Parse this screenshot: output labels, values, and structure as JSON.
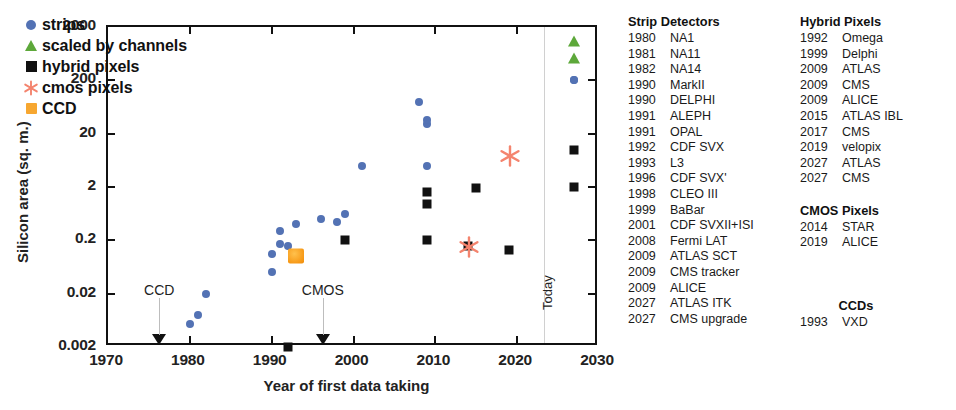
{
  "chart_data": {
    "type": "scatter",
    "title": "",
    "xlabel": "Year of first data taking",
    "ylabel": "Silicon area (sq. m.)",
    "xlim": [
      1970,
      2030
    ],
    "ylim": [
      0.002,
      2000
    ],
    "yscale": "log",
    "xticks": [
      1970,
      1980,
      1990,
      2000,
      2010,
      2020,
      2030
    ],
    "yticks": [
      0.002,
      0.02,
      0.2,
      2,
      20,
      200,
      2000
    ],
    "grid": false,
    "legend_position": "top-left",
    "legend": [
      {
        "label": "strips",
        "marker": "circle",
        "color": "#5372b4"
      },
      {
        "label": "scaled by channels",
        "marker": "triangle",
        "color": "#5da83a"
      },
      {
        "label": "hybrid pixels",
        "marker": "square",
        "color": "#111111"
      },
      {
        "label": "cmos pixels",
        "marker": "asterisk",
        "color": "#f4846e"
      },
      {
        "label": "CCD",
        "marker": "square",
        "color": "#f7a730"
      }
    ],
    "annotations": [
      {
        "text": "CCD",
        "x": 1976.5,
        "y": 0.03,
        "marker": "down-triangle-on-axis"
      },
      {
        "text": "CMOS",
        "x": 1996.5,
        "y": 0.03,
        "marker": "down-triangle-on-axis"
      },
      {
        "text": "Today",
        "x": 2023.5,
        "orientation": "vertical",
        "marker": "vertical-line"
      }
    ],
    "series": [
      {
        "name": "strips",
        "marker": "circle",
        "color": "#5372b4",
        "points": [
          [
            1980,
            0.0055
          ],
          [
            1981,
            0.008
          ],
          [
            1982,
            0.02
          ],
          [
            1990,
            0.05
          ],
          [
            1990,
            0.11
          ],
          [
            1991,
            0.17
          ],
          [
            1991,
            0.3
          ],
          [
            1992,
            0.16
          ],
          [
            1993,
            0.4
          ],
          [
            1996,
            0.5
          ],
          [
            1998,
            0.45
          ],
          [
            1999,
            0.62
          ],
          [
            2001,
            5.0
          ],
          [
            2008,
            80
          ],
          [
            2009,
            30
          ],
          [
            2009,
            36
          ],
          [
            2009,
            5.0
          ],
          [
            2027,
            200
          ],
          [
            2027,
            205
          ]
        ]
      },
      {
        "name": "scaled by channels",
        "marker": "triangle",
        "color": "#5da83a",
        "points": [
          [
            2027,
            1100
          ],
          [
            2027,
            520
          ]
        ]
      },
      {
        "name": "hybrid pixels",
        "marker": "square",
        "color": "#111111",
        "points": [
          [
            1992,
            0.002
          ],
          [
            1999,
            0.2
          ],
          [
            2009,
            1.6
          ],
          [
            2009,
            0.95
          ],
          [
            2009,
            0.2
          ],
          [
            2015,
            1.9
          ],
          [
            2014,
            0.16
          ],
          [
            2019,
            0.13
          ],
          [
            2027,
            10
          ],
          [
            2027,
            2.0
          ]
        ]
      },
      {
        "name": "cmos pixels",
        "marker": "asterisk",
        "color": "#f4846e",
        "points": [
          [
            2019,
            8.0
          ],
          [
            2014,
            0.16
          ]
        ]
      },
      {
        "name": "CCD",
        "marker": "square",
        "color": "#f7a730",
        "points": [
          [
            1993,
            0.1
          ]
        ]
      }
    ]
  },
  "tables": {
    "strip_detectors": {
      "header": "Strip Detectors",
      "rows": [
        {
          "year": "1980",
          "name": "NA1"
        },
        {
          "year": "1981",
          "name": "NA11"
        },
        {
          "year": "1982",
          "name": "NA14"
        },
        {
          "year": "1990",
          "name": "MarkII"
        },
        {
          "year": "1990",
          "name": "DELPHI"
        },
        {
          "year": "1991",
          "name": "ALEPH"
        },
        {
          "year": "1991",
          "name": "OPAL"
        },
        {
          "year": "1992",
          "name": "CDF SVX"
        },
        {
          "year": "1993",
          "name": "L3"
        },
        {
          "year": "1996",
          "name": "CDF SVX'"
        },
        {
          "year": "1998",
          "name": "CLEO III"
        },
        {
          "year": "1999",
          "name": "BaBar"
        },
        {
          "year": "2001",
          "name": "CDF SVXII+ISI"
        },
        {
          "year": "2008",
          "name": "Fermi LAT"
        },
        {
          "year": "2009",
          "name": "ATLAS SCT"
        },
        {
          "year": "2009",
          "name": "CMS tracker"
        },
        {
          "year": "2009",
          "name": "ALICE"
        },
        {
          "year": "2027",
          "name": "ATLAS ITK"
        },
        {
          "year": "2027",
          "name": "CMS upgrade"
        }
      ]
    },
    "hybrid_pixels": {
      "header": "Hybrid Pixels",
      "rows": [
        {
          "year": "1992",
          "name": "Omega"
        },
        {
          "year": "1999",
          "name": "Delphi"
        },
        {
          "year": "2009",
          "name": "ATLAS"
        },
        {
          "year": "2009",
          "name": "CMS"
        },
        {
          "year": "2009",
          "name": "ALICE"
        },
        {
          "year": "2015",
          "name": "ATLAS IBL"
        },
        {
          "year": "2017",
          "name": "CMS"
        },
        {
          "year": "2019",
          "name": "velopix"
        },
        {
          "year": "2027",
          "name": "ATLAS"
        },
        {
          "year": "2027",
          "name": "CMS"
        }
      ]
    },
    "cmos_pixels": {
      "header": "CMOS Pixels",
      "rows": [
        {
          "year": "2014",
          "name": "STAR"
        },
        {
          "year": "2019",
          "name": "ALICE"
        }
      ]
    },
    "ccds": {
      "header": "CCDs",
      "rows": [
        {
          "year": "1993",
          "name": "VXD"
        }
      ]
    }
  }
}
